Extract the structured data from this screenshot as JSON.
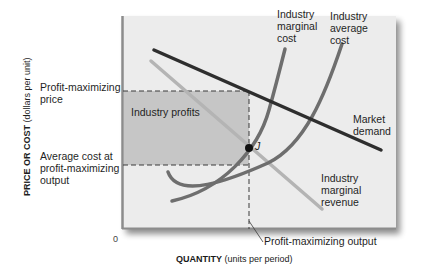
{
  "diagram": {
    "type": "economics-monopoly-profit-maximization",
    "y_axis": {
      "label_bold": "PRICE OR COST",
      "label_rest": " (dollars per unit)",
      "ticks": [
        {
          "label_line1": "Profit-maximizing",
          "label_line2": "price"
        },
        {
          "label_line1": "Average cost at",
          "label_line2": "profit-maximizing",
          "label_line3": "output"
        }
      ]
    },
    "x_axis": {
      "label_bold": "QUANTITY",
      "label_rest": " (units per period)",
      "origin": "0",
      "marker_label": "Profit-maximizing output"
    },
    "region_label": "Industry profits",
    "point_label": "J",
    "curves": {
      "mc": {
        "line1": "Industry",
        "line2": "marginal",
        "line3": "cost"
      },
      "ac": {
        "line1": "Industry",
        "line2": "average",
        "line3": "cost"
      },
      "demand": {
        "line1": "Market",
        "line2": "demand"
      },
      "mr": {
        "line1": "Industry",
        "line2": "marginal",
        "line3": "revenue"
      }
    },
    "colors": {
      "plot_bg": "#ececec",
      "profit_area": "#c6c6c6",
      "frame": "#8c8c8c",
      "demand": "#2e2e2e",
      "mr": "#b4b4b4",
      "mc": "#6e6e6e",
      "ac": "#6e6e6e"
    }
  }
}
